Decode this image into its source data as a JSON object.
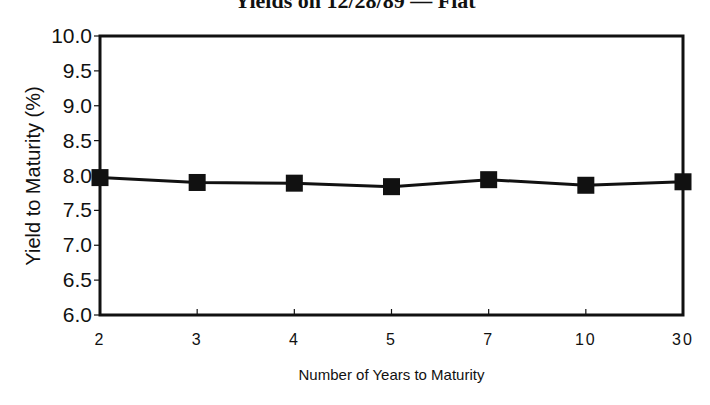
{
  "chart": {
    "title": "Yields on 12/28/89 — Flat",
    "xlabel": "Number of Years to Maturity",
    "ylabel": "Yield to Maturity (%)"
  },
  "chart_data": {
    "type": "line",
    "title": "Yields on 12/28/89 — Flat",
    "xlabel": "Number of Years to Maturity",
    "ylabel": "Yield to Maturity (%)",
    "categories": [
      "2",
      "3",
      "4",
      "5",
      "7",
      "10",
      "30"
    ],
    "series": [
      {
        "name": "Yield to Maturity",
        "marker": "square",
        "color": "#111111",
        "values": [
          7.97,
          7.9,
          7.89,
          7.84,
          7.94,
          7.86,
          7.91
        ]
      }
    ],
    "ylim": [
      6.0,
      10.0
    ],
    "yticks": [
      "6.0",
      "6.5",
      "7.0",
      "7.5",
      "8.0",
      "8.5",
      "9.0",
      "9.5",
      "10.0"
    ],
    "grid": false,
    "legend": null
  }
}
